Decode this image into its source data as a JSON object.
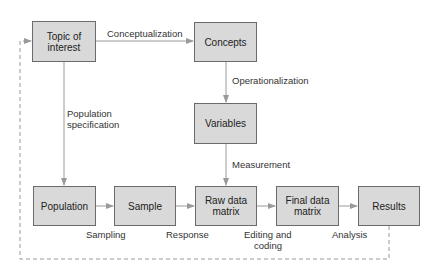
{
  "diagram": {
    "nodes": {
      "topic": "Topic of\ninterest",
      "concepts": "Concepts",
      "variables": "Variables",
      "population": "Population",
      "sample": "Sample",
      "raw": "Raw data\nmatrix",
      "final": "Final data\nmatrix",
      "results": "Results"
    },
    "edges": {
      "conceptualization": "Conceptualization",
      "operationalization": "Operationalization",
      "measurement": "Measurement",
      "population_spec_1": "Population",
      "population_spec_2": "specification",
      "sampling": "Sampling",
      "response": "Response",
      "editing_1": "Editing and",
      "editing_2": "coding",
      "analysis": "Analysis"
    },
    "colors": {
      "box_fill": "#d9d9d9",
      "box_border": "#6b6b6b",
      "arrow": "#9a9a9a"
    }
  }
}
